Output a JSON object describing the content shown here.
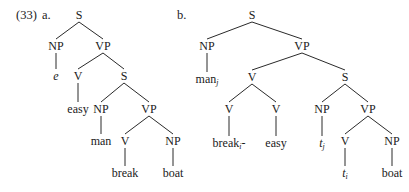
{
  "example": {
    "number": "(33)",
    "a_label": "a.",
    "b_label": "b."
  },
  "tree_a": {
    "nodes": [
      {
        "id": "S",
        "label": "S",
        "x": 79,
        "y": 15
      },
      {
        "id": "NP1",
        "label": "NP",
        "x": 56,
        "y": 46
      },
      {
        "id": "VP1",
        "label": "VP",
        "x": 103,
        "y": 46
      },
      {
        "id": "e",
        "label": "e",
        "x": 56,
        "y": 76,
        "italic": true
      },
      {
        "id": "V1",
        "label": "V",
        "x": 78,
        "y": 76
      },
      {
        "id": "S2",
        "label": "S",
        "x": 124,
        "y": 76
      },
      {
        "id": "easy",
        "label": "easy",
        "x": 78,
        "y": 109
      },
      {
        "id": "NP2",
        "label": "NP",
        "x": 101,
        "y": 109
      },
      {
        "id": "VP2",
        "label": "VP",
        "x": 149,
        "y": 109
      },
      {
        "id": "man",
        "label": "man",
        "x": 101,
        "y": 141
      },
      {
        "id": "V2",
        "label": "V",
        "x": 125,
        "y": 141
      },
      {
        "id": "NP3",
        "label": "NP",
        "x": 173,
        "y": 141
      },
      {
        "id": "break",
        "label": "break",
        "x": 125,
        "y": 173
      },
      {
        "id": "boat",
        "label": "boat",
        "x": 173,
        "y": 173
      }
    ],
    "edges": [
      [
        "S",
        "NP1"
      ],
      [
        "S",
        "VP1"
      ],
      [
        "NP1",
        "e"
      ],
      [
        "VP1",
        "V1"
      ],
      [
        "VP1",
        "S2"
      ],
      [
        "V1",
        "easy"
      ],
      [
        "S2",
        "NP2"
      ],
      [
        "S2",
        "VP2"
      ],
      [
        "NP2",
        "man"
      ],
      [
        "VP2",
        "V2"
      ],
      [
        "VP2",
        "NP3"
      ],
      [
        "V2",
        "break"
      ],
      [
        "NP3",
        "boat"
      ]
    ]
  },
  "tree_b": {
    "nodes": [
      {
        "id": "S",
        "label": "S",
        "x": 252,
        "y": 15
      },
      {
        "id": "NP1",
        "label": "NP",
        "x": 207,
        "y": 46
      },
      {
        "id": "VP1",
        "label": "VP",
        "x": 302,
        "y": 46
      },
      {
        "id": "manj",
        "label": "man",
        "sub": "j",
        "x": 207,
        "y": 79
      },
      {
        "id": "V1",
        "label": "V",
        "x": 252,
        "y": 77
      },
      {
        "id": "S2",
        "label": "S",
        "x": 345,
        "y": 77
      },
      {
        "id": "V2",
        "label": "V",
        "x": 229,
        "y": 109
      },
      {
        "id": "V3",
        "label": "V",
        "x": 276,
        "y": 109
      },
      {
        "id": "NP2",
        "label": "NP",
        "x": 322,
        "y": 109
      },
      {
        "id": "VP2",
        "label": "VP",
        "x": 368,
        "y": 109
      },
      {
        "id": "breaki",
        "label": "break",
        "sub": "i",
        "suffix": "-",
        "x": 229,
        "y": 143
      },
      {
        "id": "easy",
        "label": "easy",
        "x": 276,
        "y": 143
      },
      {
        "id": "tj",
        "label": "t",
        "sub": "j",
        "italic": true,
        "x": 322,
        "y": 143
      },
      {
        "id": "V4",
        "label": "V",
        "x": 345,
        "y": 141
      },
      {
        "id": "NP3",
        "label": "NP",
        "x": 392,
        "y": 141
      },
      {
        "id": "ti",
        "label": "t",
        "sub": "i",
        "italic": true,
        "x": 345,
        "y": 173
      },
      {
        "id": "boat",
        "label": "boat",
        "x": 392,
        "y": 173
      }
    ],
    "edges": [
      [
        "S",
        "NP1"
      ],
      [
        "S",
        "VP1"
      ],
      [
        "NP1",
        "manj"
      ],
      [
        "VP1",
        "V1"
      ],
      [
        "VP1",
        "S2"
      ],
      [
        "V1",
        "V2"
      ],
      [
        "V1",
        "V3"
      ],
      [
        "V2",
        "breaki"
      ],
      [
        "V3",
        "easy"
      ],
      [
        "S2",
        "NP2"
      ],
      [
        "S2",
        "VP2"
      ],
      [
        "NP2",
        "tj"
      ],
      [
        "VP2",
        "V4"
      ],
      [
        "VP2",
        "NP3"
      ],
      [
        "V4",
        "ti"
      ],
      [
        "NP3",
        "boat"
      ]
    ]
  },
  "style": {
    "line_color": "#2a2a2a",
    "text_color": "#1a1a1a"
  }
}
